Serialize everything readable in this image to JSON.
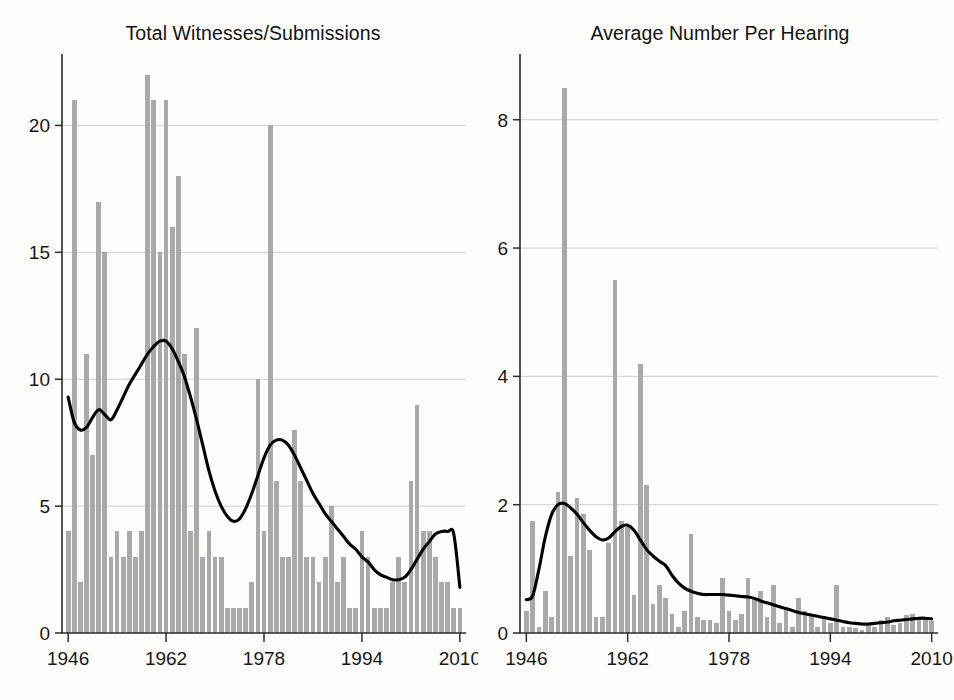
{
  "figure": {
    "background_color": "#fdfdfc",
    "bar_color": "#a9a9a9",
    "line_color": "#000000",
    "grid_color": "#c9c9c9",
    "axis_color": "#2b2b2b"
  },
  "panels": {
    "left": {
      "title": "Total Witnesses/Submissions",
      "y_ticks": [
        "0",
        "5",
        "10",
        "15",
        "20"
      ],
      "x_ticks": [
        "1946",
        "1962",
        "1978",
        "1994",
        "2010"
      ]
    },
    "right": {
      "title": "Average Number Per Hearing",
      "y_ticks": [
        "0",
        "2",
        "4",
        "6",
        "8"
      ],
      "x_ticks": [
        "1946",
        "1962",
        "1978",
        "1994",
        "2010"
      ]
    }
  },
  "chart_data": [
    {
      "type": "bar",
      "panel": "left",
      "title": "Total Witnesses/Submissions",
      "xlabel": "",
      "ylabel": "",
      "xlim": [
        1945,
        2011
      ],
      "ylim": [
        0,
        22.5
      ],
      "y_ticks": [
        0,
        5,
        10,
        15,
        20
      ],
      "x_ticks": [
        1946,
        1962,
        1978,
        1994,
        2010
      ],
      "grid": true,
      "grid_axis": "y",
      "legend": "none",
      "x": [
        1946,
        1947,
        1948,
        1949,
        1950,
        1951,
        1952,
        1953,
        1954,
        1955,
        1956,
        1957,
        1958,
        1959,
        1960,
        1961,
        1962,
        1963,
        1964,
        1965,
        1966,
        1967,
        1968,
        1969,
        1970,
        1971,
        1972,
        1973,
        1974,
        1975,
        1976,
        1977,
        1978,
        1979,
        1980,
        1981,
        1982,
        1983,
        1984,
        1985,
        1986,
        1987,
        1988,
        1989,
        1990,
        1991,
        1992,
        1993,
        1994,
        1995,
        1996,
        1997,
        1998,
        1999,
        2000,
        2001,
        2002,
        2003,
        2004,
        2005,
        2006,
        2007,
        2008,
        2009,
        2010
      ],
      "values": [
        4,
        21,
        2,
        11,
        7,
        17,
        15,
        3,
        4,
        3,
        4,
        3,
        4,
        22,
        21,
        15,
        21,
        16,
        18,
        11,
        4,
        12,
        3,
        4,
        3,
        3,
        1,
        1,
        1,
        1,
        2,
        10,
        4,
        20,
        6,
        3,
        3,
        8,
        6,
        3,
        3,
        2,
        3,
        5,
        2,
        3,
        1,
        1,
        4,
        3,
        1,
        1,
        1,
        2,
        3,
        2,
        6,
        9,
        4,
        4,
        3,
        2,
        2,
        1,
        1
      ],
      "series_secondary": {
        "name": "Smoothed trend (lowess)",
        "type": "line",
        "x": [
          1946,
          1947,
          1948,
          1949,
          1950,
          1951,
          1952,
          1953,
          1954,
          1955,
          1956,
          1957,
          1958,
          1959,
          1960,
          1961,
          1962,
          1963,
          1964,
          1965,
          1966,
          1967,
          1968,
          1969,
          1970,
          1971,
          1972,
          1973,
          1974,
          1975,
          1976,
          1977,
          1978,
          1979,
          1980,
          1981,
          1982,
          1983,
          1984,
          1985,
          1986,
          1987,
          1988,
          1989,
          1990,
          1991,
          1992,
          1993,
          1994,
          1995,
          1996,
          1997,
          1998,
          1999,
          2000,
          2001,
          2002,
          2003,
          2004,
          2005,
          2006,
          2007,
          2008,
          2009,
          2010
        ],
        "values": [
          9.3,
          8.3,
          8.0,
          8.1,
          8.5,
          8.8,
          8.6,
          8.4,
          8.8,
          9.3,
          9.8,
          10.2,
          10.6,
          11.0,
          11.3,
          11.5,
          11.5,
          11.2,
          10.7,
          10.1,
          9.3,
          8.4,
          7.4,
          6.4,
          5.6,
          5.0,
          4.6,
          4.4,
          4.5,
          4.9,
          5.5,
          6.2,
          6.9,
          7.4,
          7.6,
          7.6,
          7.4,
          7.0,
          6.5,
          6.0,
          5.5,
          5.1,
          4.7,
          4.4,
          4.1,
          3.8,
          3.5,
          3.3,
          3.0,
          2.8,
          2.5,
          2.3,
          2.2,
          2.1,
          2.1,
          2.2,
          2.5,
          2.9,
          3.3,
          3.6,
          3.9,
          4.0,
          4.0,
          3.9,
          1.8
        ]
      }
    },
    {
      "type": "bar",
      "panel": "right",
      "title": "Average Number Per Hearing",
      "xlabel": "",
      "ylabel": "",
      "xlim": [
        1945,
        2011
      ],
      "ylim": [
        0,
        8.9
      ],
      "y_ticks": [
        0,
        2,
        4,
        6,
        8
      ],
      "x_ticks": [
        1946,
        1962,
        1978,
        1994,
        2010
      ],
      "grid": true,
      "grid_axis": "y",
      "legend": "none",
      "x": [
        1946,
        1947,
        1948,
        1949,
        1950,
        1951,
        1952,
        1953,
        1954,
        1955,
        1956,
        1957,
        1958,
        1959,
        1960,
        1961,
        1962,
        1963,
        1964,
        1965,
        1966,
        1967,
        1968,
        1969,
        1970,
        1971,
        1972,
        1973,
        1974,
        1975,
        1976,
        1977,
        1978,
        1979,
        1980,
        1981,
        1982,
        1983,
        1984,
        1985,
        1986,
        1987,
        1988,
        1989,
        1990,
        1991,
        1992,
        1993,
        1994,
        1995,
        1996,
        1997,
        1998,
        1999,
        2000,
        2001,
        2002,
        2003,
        2004,
        2005,
        2006,
        2007,
        2008,
        2009,
        2010
      ],
      "values": [
        0.35,
        1.75,
        0.1,
        0.65,
        0.25,
        2.2,
        8.5,
        1.2,
        2.1,
        1.85,
        1.3,
        0.25,
        0.25,
        1.4,
        5.5,
        1.75,
        1.65,
        0.6,
        4.2,
        2.3,
        0.45,
        0.75,
        0.55,
        0.3,
        0.1,
        0.35,
        1.55,
        0.25,
        0.2,
        0.2,
        0.15,
        0.85,
        0.35,
        0.2,
        0.3,
        0.85,
        0.55,
        0.65,
        0.25,
        0.75,
        0.15,
        0.4,
        0.1,
        0.55,
        0.35,
        0.3,
        0.1,
        0.25,
        0.15,
        0.75,
        0.1,
        0.1,
        0.08,
        0.05,
        0.12,
        0.1,
        0.2,
        0.25,
        0.12,
        0.15,
        0.28,
        0.3,
        0.25,
        0.22,
        0.18
      ],
      "series_secondary": {
        "name": "Smoothed trend (lowess)",
        "type": "line",
        "x": [
          1946,
          1947,
          1948,
          1949,
          1950,
          1951,
          1952,
          1953,
          1954,
          1955,
          1956,
          1957,
          1958,
          1959,
          1960,
          1961,
          1962,
          1963,
          1964,
          1965,
          1966,
          1967,
          1968,
          1969,
          1970,
          1971,
          1972,
          1973,
          1974,
          1975,
          1976,
          1977,
          1978,
          1979,
          1980,
          1981,
          1982,
          1983,
          1984,
          1985,
          1986,
          1987,
          1988,
          1989,
          1990,
          1991,
          1992,
          1993,
          1994,
          1995,
          1996,
          1997,
          1998,
          1999,
          2000,
          2001,
          2002,
          2003,
          2004,
          2005,
          2006,
          2007,
          2008,
          2009,
          2010
        ],
        "values": [
          0.52,
          0.58,
          1.0,
          1.5,
          1.85,
          2.0,
          2.02,
          1.95,
          1.85,
          1.72,
          1.6,
          1.5,
          1.45,
          1.48,
          1.58,
          1.66,
          1.68,
          1.6,
          1.45,
          1.3,
          1.2,
          1.12,
          1.05,
          0.9,
          0.78,
          0.7,
          0.65,
          0.62,
          0.6,
          0.6,
          0.6,
          0.6,
          0.59,
          0.58,
          0.57,
          0.56,
          0.54,
          0.5,
          0.47,
          0.44,
          0.41,
          0.38,
          0.35,
          0.32,
          0.3,
          0.28,
          0.26,
          0.24,
          0.22,
          0.2,
          0.18,
          0.16,
          0.15,
          0.14,
          0.14,
          0.15,
          0.16,
          0.17,
          0.19,
          0.2,
          0.21,
          0.22,
          0.23,
          0.23,
          0.22
        ]
      }
    }
  ]
}
